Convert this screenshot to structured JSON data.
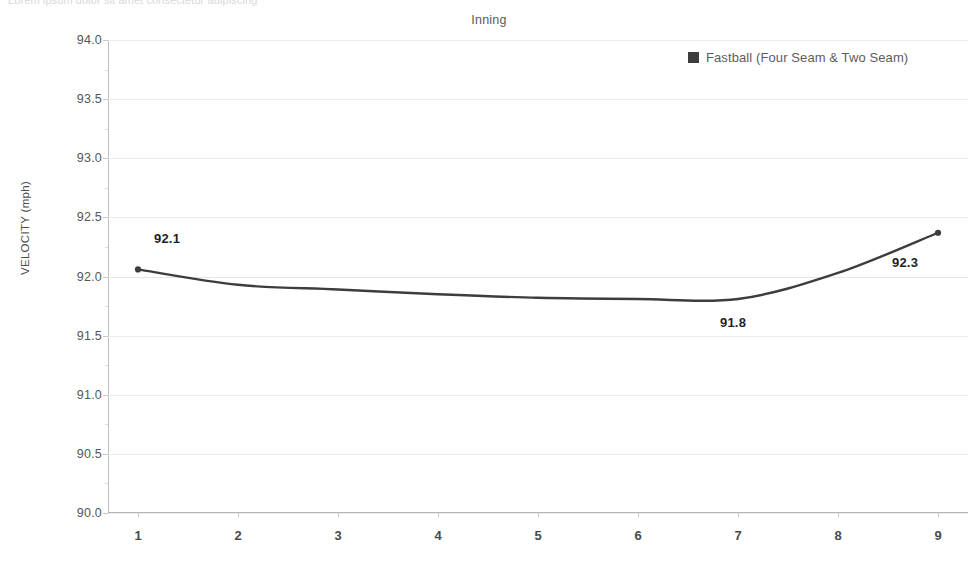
{
  "clipped_header_text": "Lorem ipsum dolor sit amet consectetur adipiscing",
  "chart_data": {
    "type": "line",
    "title": "Inning",
    "xlabel": "Inning",
    "ylabel": "VELOCITY (mph)",
    "categories": [
      "1",
      "2",
      "3",
      "4",
      "5",
      "6",
      "7",
      "8",
      "9"
    ],
    "x": [
      1,
      2,
      3,
      4,
      5,
      6,
      7,
      8,
      9
    ],
    "series": [
      {
        "name": "Fastball (Four Seam & Two Seam)",
        "color": "#3d3d3d",
        "values": [
          92.06,
          91.93,
          91.89,
          91.85,
          91.82,
          91.81,
          91.81,
          92.03,
          92.37
        ]
      }
    ],
    "ylim": [
      90.0,
      94.0
    ],
    "ytick_labels": [
      "90.0",
      "90.5",
      "91.0",
      "91.5",
      "92.0",
      "92.5",
      "93.0",
      "93.5",
      "94.0"
    ],
    "ytick_values": [
      90.0,
      90.5,
      91.0,
      91.5,
      92.0,
      92.5,
      93.0,
      93.5,
      94.0
    ],
    "grid": true,
    "legend_position": "top-right",
    "point_labels": [
      {
        "x": 1,
        "value": 92.06,
        "text": "92.1",
        "dx": 16,
        "dy": -38
      },
      {
        "x": 7,
        "value": 91.81,
        "text": "91.8",
        "dx": -18,
        "dy": 16
      },
      {
        "x": 9,
        "value": 92.37,
        "text": "92.3",
        "dx": -46,
        "dy": 22
      }
    ]
  },
  "legend": {
    "label": "Fastball (Four Seam & Two Seam)",
    "swatch_color": "#3d3d3d"
  },
  "axis": {
    "top_title": "Inning",
    "y_title": "VELOCITY (mph)"
  }
}
